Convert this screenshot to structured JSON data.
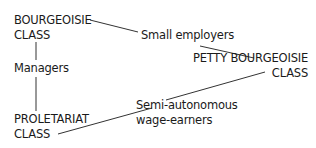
{
  "nodes": {
    "bourgeoisie": {
      "line1": "BOURGEOISIE",
      "line2": "CLASS"
    },
    "small_employers": {
      "label": "Small employers"
    },
    "managers": {
      "label": "Managers"
    },
    "petty_bourgeoisie": {
      "line1": "PETTY BOURGEOISIE",
      "line2": "CLASS"
    },
    "proletariat": {
      "line1": "PROLETARIAT",
      "line2": "CLASS"
    },
    "semi_autonomous": {
      "line1": "Semi-autonomous",
      "line2": "wage-earners"
    }
  },
  "edges": [
    {
      "from": "bourgeoisie",
      "to": "small_employers"
    },
    {
      "from": "small_employers",
      "to": "petty_bourgeoisie"
    },
    {
      "from": "bourgeoisie",
      "to": "managers"
    },
    {
      "from": "managers",
      "to": "proletariat"
    },
    {
      "from": "petty_bourgeoisie",
      "to": "semi_autonomous"
    },
    {
      "from": "semi_autonomous",
      "to": "proletariat"
    }
  ],
  "colors": {
    "line": "#333333",
    "text": "#1a1a1a"
  }
}
